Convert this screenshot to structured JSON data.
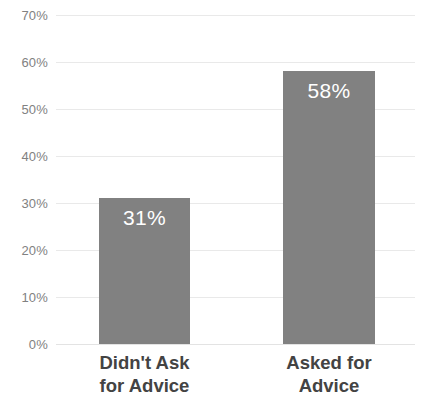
{
  "chart_data": {
    "type": "bar",
    "title": "",
    "subtitle": "",
    "xlabel": "",
    "ylabel": "",
    "categories": [
      "Didn't Ask for Advice",
      "Asked for Advice"
    ],
    "category_lines": [
      [
        "Didn't Ask",
        "for Advice"
      ],
      [
        "Asked for",
        "Advice"
      ]
    ],
    "values": [
      31,
      58
    ],
    "value_labels": [
      "31%",
      "58%"
    ],
    "ylim": [
      0,
      70
    ],
    "ytick_values": [
      0,
      10,
      20,
      30,
      40,
      50,
      60,
      70
    ],
    "ytick_labels": [
      "0%",
      "10%",
      "20%",
      "30%",
      "40%",
      "50%",
      "60%",
      "70%"
    ],
    "grid": true,
    "legend": false,
    "legend_position": "none",
    "bar_color": "#818181",
    "value_label_color": "#ffffff",
    "tick_label_color": "#818181",
    "category_label_color": "#434343",
    "gridline_color": "#e9e9e9",
    "background_color": "#ffffff"
  }
}
